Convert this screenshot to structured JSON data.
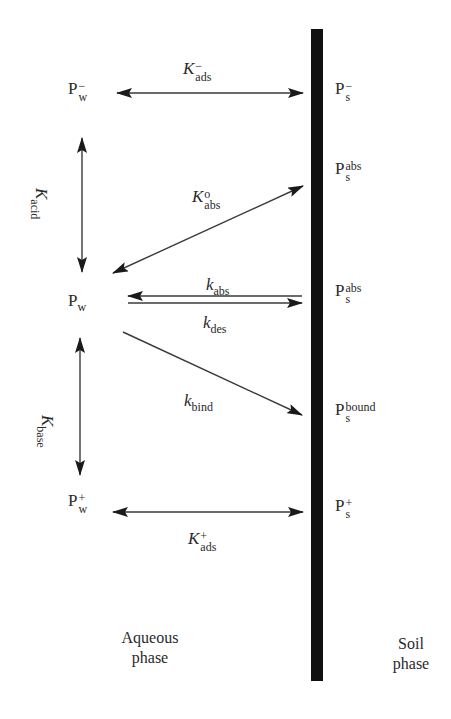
{
  "diagram": {
    "type": "reaction-scheme",
    "interface": {
      "label": "soil-water interface",
      "color": "#111111"
    },
    "aqueous_species": {
      "anion": {
        "base": "P",
        "sub": "w",
        "sup": "−"
      },
      "neutral": {
        "base": "P",
        "sub": "w"
      },
      "cation": {
        "base": "P",
        "sub": "w",
        "sup": "+"
      }
    },
    "soil_species": {
      "anion": {
        "base": "P",
        "sub": "s",
        "sup": "−"
      },
      "abs_outer": {
        "base": "P",
        "sub": "s",
        "sup": "abs"
      },
      "abs_inner": {
        "base": "P",
        "sub": "s",
        "sup": "abs"
      },
      "bound": {
        "base": "P",
        "sub": "s",
        "sup": "bound"
      },
      "cation": {
        "base": "P",
        "sub": "s",
        "sup": "+"
      }
    },
    "rate_constants": {
      "k_ads_minus": {
        "base": "K",
        "sub": "ads",
        "sup": "−"
      },
      "k_acid": {
        "base": "K",
        "sub": "acid"
      },
      "k_abs_zero": {
        "base": "K",
        "sub": "abs",
        "sup": "o"
      },
      "k_abs": {
        "base": "k",
        "sub": "abs"
      },
      "k_des": {
        "base": "k",
        "sub": "des"
      },
      "k_bind": {
        "base": "k",
        "sub": "bind"
      },
      "k_base": {
        "base": "K",
        "sub": "base"
      },
      "k_ads_plus": {
        "base": "K",
        "sub": "ads",
        "sup": "+"
      }
    },
    "phases": {
      "aqueous": {
        "line1": "Aqueous",
        "line2": "phase"
      },
      "soil": {
        "line1": "Soil",
        "line2": "phase"
      }
    },
    "arrows": [
      {
        "name": "k-ads-minus-arrow",
        "from": "P_w^-",
        "to": "P_s^-",
        "type": "bidirectional"
      },
      {
        "name": "k-acid-arrow",
        "from": "P_w^-",
        "to": "P_w",
        "type": "bidirectional"
      },
      {
        "name": "k-abs-zero-arrow",
        "from": "P_w",
        "to": "P_s^abs",
        "type": "bidirectional"
      },
      {
        "name": "k-abs-arrow",
        "from": "P_s^abs",
        "to": "P_w",
        "type": "unidirectional"
      },
      {
        "name": "k-des-arrow",
        "from": "P_w",
        "to": "P_s^abs",
        "type": "unidirectional"
      },
      {
        "name": "k-bind-arrow",
        "from": "P_w",
        "to": "P_s^bound",
        "type": "unidirectional"
      },
      {
        "name": "k-base-arrow",
        "from": "P_w",
        "to": "P_w^+",
        "type": "bidirectional"
      },
      {
        "name": "k-ads-plus-arrow",
        "from": "P_w^+",
        "to": "P_s^+",
        "type": "bidirectional"
      }
    ]
  }
}
